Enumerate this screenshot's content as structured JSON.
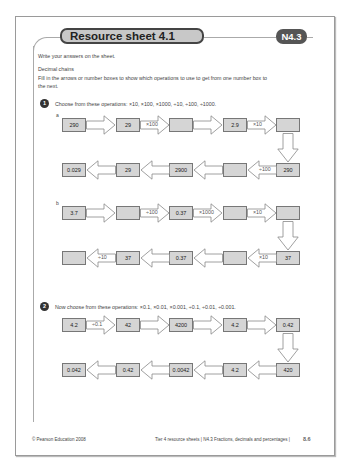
{
  "header": {
    "title": "Resource sheet 4.1",
    "code": "N4.3"
  },
  "intro": "Write your answers on the sheet.",
  "section_title": "Decimal chains",
  "instructions_line1": "Fill in the arrows or number boxes to show which operations to use to get from one number box to",
  "instructions_line2": "the next.",
  "q1": {
    "number": "1",
    "prompt": "Choose from these operations: ×10, ×100, ×1000, ÷10, ÷100, ÷1000.",
    "a": {
      "label": "a",
      "top_boxes": [
        "290",
        "29",
        "",
        "2.9",
        ""
      ],
      "top_arrows": [
        "",
        "×100",
        "",
        "×10"
      ],
      "bottom_boxes": [
        "0.029",
        "29",
        "2900",
        "",
        "290"
      ],
      "bottom_arrows": [
        "",
        "",
        "",
        "÷100"
      ]
    },
    "b": {
      "label": "b",
      "top_boxes": [
        "3.7",
        "",
        "0.37",
        "",
        ""
      ],
      "top_arrows": [
        "",
        "÷100",
        "×1000",
        "×10"
      ],
      "bottom_boxes": [
        "",
        "37",
        "0.37",
        "",
        "37"
      ],
      "bottom_arrows": [
        "÷10",
        "",
        "",
        "×10"
      ]
    }
  },
  "q2": {
    "number": "2",
    "prompt": "Now choose from these operations: ×0.1, ×0.01, ×0.001, ÷0.1, ÷0.01, ÷0.001.",
    "top_boxes": [
      "4.2",
      "42",
      "4200",
      "4.2",
      "0.42"
    ],
    "top_arrows": [
      "÷0.1",
      "",
      "",
      ""
    ],
    "bottom_boxes": [
      "0.042",
      "0.42",
      "0.0042",
      "4.2",
      "420"
    ],
    "bottom_arrows": [
      "",
      "",
      "",
      ""
    ]
  },
  "footer": {
    "copyright": "© Pearson Education 2008",
    "source": "Tier 4 resource sheets | N4.3 Fractions, decimals and percentages |",
    "page": "8.6"
  }
}
